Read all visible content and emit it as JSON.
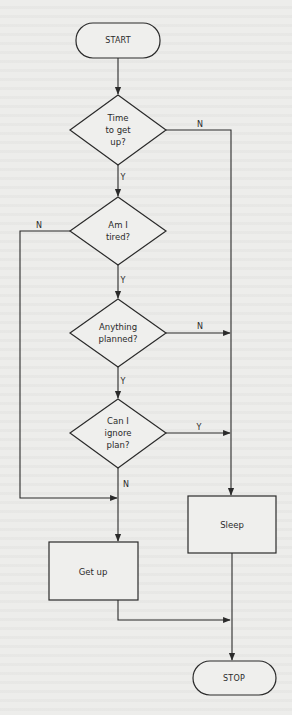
{
  "diagram": {
    "type": "flowchart",
    "colors": {
      "background": "#ededeb",
      "stroke": "#2a2a2a"
    },
    "nodes": {
      "start": {
        "label": "START",
        "shape": "terminal",
        "x": 118,
        "y": 40,
        "w": 84,
        "h": 34
      },
      "time": {
        "label": "Time\nto get\nup?",
        "shape": "decision",
        "x": 118,
        "y": 130,
        "w": 96,
        "h": 70
      },
      "tired": {
        "label": "Am I\ntired?",
        "shape": "decision",
        "x": 118,
        "y": 231,
        "w": 96,
        "h": 68
      },
      "planned": {
        "label": "Anything\nplanned?",
        "shape": "decision",
        "x": 118,
        "y": 333,
        "w": 96,
        "h": 68
      },
      "ignore": {
        "label": "Can I\nignore\nplan?",
        "shape": "decision",
        "x": 118,
        "y": 433,
        "w": 96,
        "h": 69
      },
      "sleep": {
        "label": "Sleep",
        "shape": "process",
        "x": 232,
        "y": 525,
        "w": 88,
        "h": 57
      },
      "getup": {
        "label": "Get up",
        "shape": "process",
        "x": 93,
        "y": 571,
        "w": 89,
        "h": 58
      },
      "stop": {
        "label": "STOP",
        "shape": "terminal",
        "x": 234,
        "y": 678,
        "w": 83,
        "h": 34
      }
    },
    "edges": [
      {
        "from": "start",
        "to": "time",
        "label": ""
      },
      {
        "from": "time",
        "to": "tired",
        "label": "Y"
      },
      {
        "from": "time",
        "to": "sleep",
        "label": "N"
      },
      {
        "from": "tired",
        "to": "planned",
        "label": "Y"
      },
      {
        "from": "tired",
        "to": "getup",
        "label": "N"
      },
      {
        "from": "planned",
        "to": "ignore",
        "label": "Y"
      },
      {
        "from": "planned",
        "to": "sleep",
        "label": "N"
      },
      {
        "from": "ignore",
        "to": "sleep",
        "label": "Y"
      },
      {
        "from": "ignore",
        "to": "getup",
        "label": "N"
      },
      {
        "from": "getup",
        "to": "stop",
        "label": ""
      },
      {
        "from": "sleep",
        "to": "stop",
        "label": ""
      }
    ],
    "edge_labels": {
      "time_n": "N",
      "time_y": "Y",
      "tired_n": "N",
      "tired_y": "Y",
      "planned_n": "N",
      "planned_y": "Y",
      "ignore_y": "Y",
      "ignore_n": "N"
    }
  }
}
